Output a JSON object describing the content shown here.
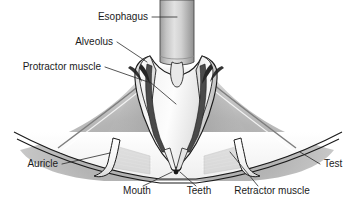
{
  "figure": {
    "background_color": "#ffffff",
    "text_color": "#1b1b1b",
    "line_color": "#2a2a2a",
    "width": 354,
    "height": 207
  },
  "labels": [
    {
      "id": "esophagus",
      "text": "Esophagus",
      "x": 148,
      "y": 20,
      "anchor": "end"
    },
    {
      "id": "alveolus",
      "text": "Alveolus",
      "x": 113,
      "y": 45,
      "anchor": "end"
    },
    {
      "id": "protractor",
      "text": "Protractor muscle",
      "x": 101,
      "y": 70,
      "anchor": "end"
    },
    {
      "id": "auricle",
      "text": "Auricle",
      "x": 58,
      "y": 167,
      "anchor": "end"
    },
    {
      "id": "mouth",
      "text": "Mouth",
      "x": 137,
      "y": 194,
      "anchor": "middle"
    },
    {
      "id": "teeth",
      "text": "Teeth",
      "x": 199,
      "y": 194,
      "anchor": "middle"
    },
    {
      "id": "retractor",
      "text": "Retractor muscle",
      "x": 272,
      "y": 194,
      "anchor": "middle"
    },
    {
      "id": "test",
      "text": "Test",
      "x": 324,
      "y": 167,
      "anchor": "start"
    }
  ],
  "structures": {
    "esophagus": {
      "name": "esophagus-tube",
      "fill": "#c9c9c9"
    },
    "pharynx": {
      "name": "pharynx-lantern",
      "fill": "#f2f2f2"
    },
    "alveolus": {
      "name": "alveolus-plate",
      "fill": "#fbfbfb"
    },
    "muscle_band": {
      "name": "dark-muscle-band",
      "fill": "#3a3a3a"
    },
    "body_wall": {
      "name": "body-wall-mass",
      "fill": "#b9b9b9"
    },
    "auricle": {
      "name": "auricle-flap",
      "fill": "#fafafa"
    },
    "test_wall": {
      "name": "test-outer-wall",
      "fill": "#ffffff"
    },
    "teeth": {
      "name": "teeth-tip",
      "fill": "#2b2b2b"
    }
  }
}
